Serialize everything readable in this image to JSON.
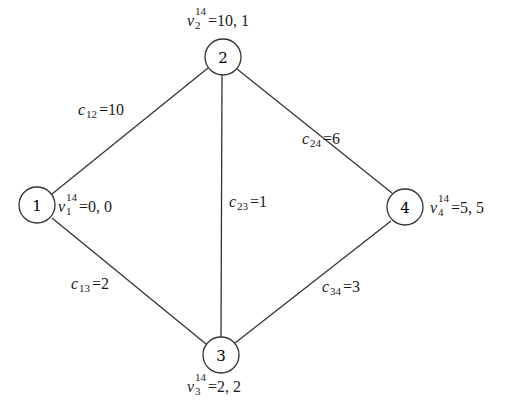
{
  "graph": {
    "nodes": [
      {
        "id": "1",
        "label": "1",
        "x": 37,
        "y": 205,
        "value_var": "v",
        "value_sub": "1",
        "value_sup": "14",
        "value": "=0, 0"
      },
      {
        "id": "2",
        "label": "2",
        "x": 223,
        "y": 57,
        "value_var": "v",
        "value_sub": "2",
        "value_sup": "14",
        "value": "=10, 1"
      },
      {
        "id": "3",
        "label": "3",
        "x": 221,
        "y": 355,
        "value_var": "v",
        "value_sub": "3",
        "value_sup": "14",
        "value": "=2, 2"
      },
      {
        "id": "4",
        "label": "4",
        "x": 405,
        "y": 207,
        "value_var": "v",
        "value_sub": "4",
        "value_sup": "14",
        "value": "=5, 5"
      }
    ],
    "edges": [
      {
        "from": "1",
        "to": "2",
        "var": "c",
        "sub": "12",
        "value": "=10"
      },
      {
        "from": "2",
        "to": "3",
        "var": "c",
        "sub": "23",
        "value": "=1"
      },
      {
        "from": "2",
        "to": "4",
        "var": "c",
        "sub": "24",
        "value": "=6"
      },
      {
        "from": "1",
        "to": "3",
        "var": "c",
        "sub": "13",
        "value": "=2"
      },
      {
        "from": "3",
        "to": "4",
        "var": "c",
        "sub": "34",
        "value": "=3"
      }
    ]
  }
}
